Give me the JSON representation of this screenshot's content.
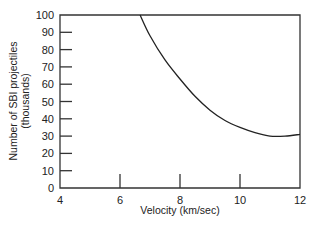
{
  "chart_data": {
    "type": "line",
    "title": "",
    "xlabel": "Velocity (km/sec)",
    "ylabel": "Number of SBI projectiles",
    "ylabel_line2": "(thousands)",
    "xlim": [
      4,
      12
    ],
    "ylim": [
      0,
      100
    ],
    "x_ticks": [
      "4",
      "6",
      "8",
      "10",
      "12"
    ],
    "y_ticks": [
      "0",
      "10",
      "20",
      "30",
      "40",
      "50",
      "60",
      "70",
      "80",
      "90",
      "100"
    ],
    "grid": false,
    "legend": null,
    "series": [
      {
        "name": "SBI projectiles",
        "x": [
          6.67,
          7.0,
          7.5,
          8.0,
          8.5,
          9.0,
          9.5,
          10.0,
          10.5,
          11.0,
          11.5,
          12.0
        ],
        "y": [
          100,
          88,
          74,
          63,
          53,
          45,
          39,
          35,
          32,
          30,
          30,
          31
        ]
      }
    ]
  }
}
